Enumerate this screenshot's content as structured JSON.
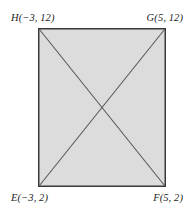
{
  "figure": {
    "kind": "rectangle-with-diagonals",
    "shape_name": "rectangle-efgh",
    "background_color": "#ffffff",
    "fill_color": "#dcdcdc",
    "stroke_color": "#3a3a3a",
    "diagonal_color": "#555555",
    "label_color": "#1c1c1c",
    "rect": {
      "x": 38,
      "y": 28,
      "width": 128,
      "height": 159
    },
    "vertices": [
      {
        "id": "H",
        "position": "top-left",
        "label": "H(−3, 12)",
        "x": -3,
        "y": 12
      },
      {
        "id": "G",
        "position": "top-right",
        "label": "G(5, 12)",
        "x": 5,
        "y": 12
      },
      {
        "id": "E",
        "position": "bottom-left",
        "label": "E(−3, 2)",
        "x": -3,
        "y": 2
      },
      {
        "id": "F",
        "position": "bottom-right",
        "label": "F(5, 2)",
        "x": 5,
        "y": 2
      }
    ],
    "diagonals": [
      {
        "id": "HF",
        "from": "H",
        "to": "F"
      },
      {
        "id": "EG",
        "from": "E",
        "to": "G"
      }
    ]
  }
}
